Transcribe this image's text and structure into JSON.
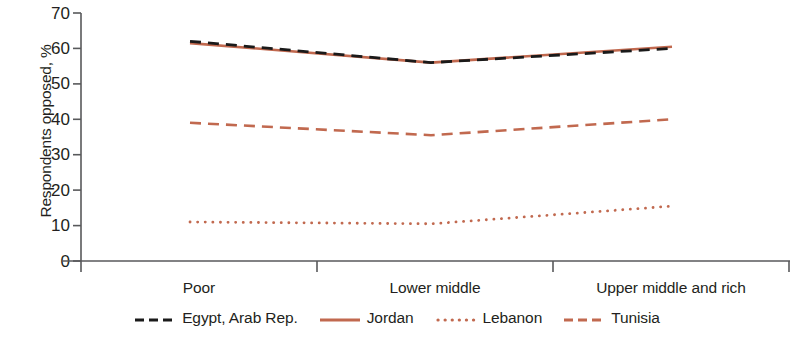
{
  "chart_data": {
    "type": "line",
    "title": "",
    "subtitle": "",
    "xlabel": "",
    "ylabel": "Respondents opposed, %",
    "categories": [
      "Poor",
      "Lower middle",
      "Upper middle and rich"
    ],
    "ylim": [
      0,
      70
    ],
    "yticks": [
      0,
      10,
      20,
      30,
      40,
      50,
      60,
      70
    ],
    "ytick_labels": [
      "0",
      "10",
      "20",
      "30",
      "40",
      "50",
      "60",
      "70"
    ],
    "grid": false,
    "legend_position": "bottom",
    "series": [
      {
        "name": "Egypt, Arab Rep.",
        "values": [
          62.0,
          56.0,
          60.0
        ],
        "color": "#1a1a1a",
        "style": "dashed"
      },
      {
        "name": "Jordan",
        "values": [
          61.5,
          56.0,
          60.5
        ],
        "color": "#c1694f",
        "style": "solid"
      },
      {
        "name": "Lebanon",
        "values": [
          11.0,
          10.5,
          15.5
        ],
        "color": "#c1694f",
        "style": "dotted"
      },
      {
        "name": "Tunisia",
        "values": [
          39.0,
          35.5,
          40.0
        ],
        "color": "#c1694f",
        "style": "dashed"
      }
    ]
  },
  "axis": {
    "y_title": "Respondents opposed, %",
    "y_labels": [
      "70",
      "60",
      "50",
      "40",
      "30",
      "20",
      "10",
      "0"
    ],
    "x_labels": [
      "Poor",
      "Lower middle",
      "Upper middle and rich"
    ]
  },
  "legend": {
    "items": [
      {
        "label": "Egypt, Arab Rep.",
        "color": "#1a1a1a",
        "style": "dashed"
      },
      {
        "label": "Jordan",
        "color": "#c1694f",
        "style": "solid"
      },
      {
        "label": "Lebanon",
        "color": "#c1694f",
        "style": "dotted"
      },
      {
        "label": "Tunisia",
        "color": "#c1694f",
        "style": "dashed"
      }
    ]
  },
  "colors": {
    "axis": "#58595b",
    "text": "#231f20",
    "accent_orange": "#c1694f",
    "accent_black": "#1a1a1a",
    "background": "#ffffff"
  }
}
